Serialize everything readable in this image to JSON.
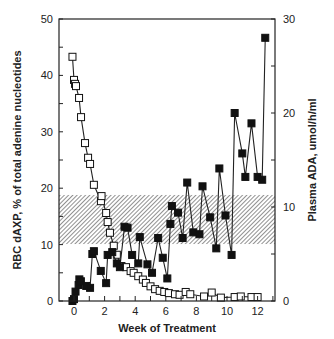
{
  "chart_data": {
    "type": "line",
    "title": "",
    "xlabel": "Week of Treatment",
    "ylabel": "RBC dAXP, % of total adenine nucleotides",
    "y2label": "Plasma ADA, umol/h/ml",
    "xlim": [
      -0.5,
      13
    ],
    "ylim": [
      0,
      50
    ],
    "y2lim": [
      0,
      30
    ],
    "x_ticks": [
      0,
      2,
      4,
      6,
      8,
      10,
      12
    ],
    "y_ticks": [
      0,
      10,
      20,
      30,
      40,
      50
    ],
    "y2_ticks": [
      0,
      10,
      20,
      30
    ],
    "grid": false,
    "legend": null,
    "shaded_band": {
      "axis": "left",
      "y_from": 10.1,
      "y_to": 18.8,
      "pattern": "diagonal-hatch"
    },
    "series": [
      {
        "name": "RBC dAXP",
        "axis": "left",
        "marker": "open-square",
        "x": [
          -0.1,
          0.0,
          0.07,
          0.13,
          0.33,
          0.46,
          0.72,
          0.92,
          1.05,
          1.3,
          1.76,
          1.8,
          2.1,
          2.2,
          2.35,
          2.6,
          2.8,
          3.1,
          3.4,
          3.7,
          3.9,
          4.2,
          4.5,
          4.7,
          5.0,
          5.3,
          5.6,
          5.9,
          6.2,
          6.6,
          6.9,
          7.3,
          7.6,
          8.5,
          9.0,
          9.6,
          10.5,
          10.9,
          11.6,
          12.0
        ],
        "values": [
          43.3,
          39.2,
          38.5,
          38.1,
          36.0,
          32.6,
          28.0,
          25.4,
          24.3,
          20.6,
          17.7,
          18.6,
          15.6,
          14.0,
          12.1,
          9.8,
          8.2,
          6.2,
          6.0,
          5.3,
          5.0,
          4.4,
          3.8,
          3.2,
          2.6,
          2.1,
          1.8,
          1.6,
          1.4,
          1.2,
          1.1,
          1.6,
          1.2,
          0.8,
          1.5,
          0.6,
          0.7,
          0.8,
          0.7,
          0.7
        ]
      },
      {
        "name": "Plasma ADA",
        "axis": "right",
        "marker": "filled-square",
        "x": [
          -0.1,
          0.0,
          0.1,
          0.3,
          0.35,
          0.45,
          0.8,
          1.05,
          1.2,
          1.3,
          1.75,
          2.1,
          2.2,
          2.5,
          2.8,
          3.0,
          3.3,
          3.5,
          3.8,
          4.2,
          4.3,
          4.8,
          5.1,
          5.5,
          5.8,
          6.1,
          6.3,
          6.4,
          6.8,
          7.1,
          7.4,
          7.8,
          8.2,
          8.4,
          8.9,
          9.3,
          9.5,
          9.9,
          10.3,
          10.5,
          11.0,
          11.2,
          11.6,
          12.0,
          12.3,
          12.5
        ],
        "values": [
          0,
          0.2,
          1.0,
          1.7,
          2.3,
          2.1,
          1.6,
          1.4,
          5.0,
          5.3,
          3.2,
          1.9,
          4.9,
          5.2,
          4.0,
          3.6,
          7.9,
          7.8,
          4.9,
          4.0,
          6.8,
          3.9,
          3.0,
          6.7,
          4.6,
          2.4,
          8.2,
          10.1,
          9.4,
          6.7,
          12.6,
          7.3,
          7.1,
          12.2,
          8.9,
          5.6,
          14.1,
          9.1,
          4.9,
          20.0,
          15.7,
          13.2,
          18.9,
          13.2,
          12.9,
          28.0
        ]
      }
    ]
  },
  "labels": {
    "x_axis_title": "Week of Treatment",
    "y_axis_title": "RBC dAXP, % of total adenine nucleotides",
    "y2_axis_title": "Plasma ADA, umol/h/ml"
  }
}
